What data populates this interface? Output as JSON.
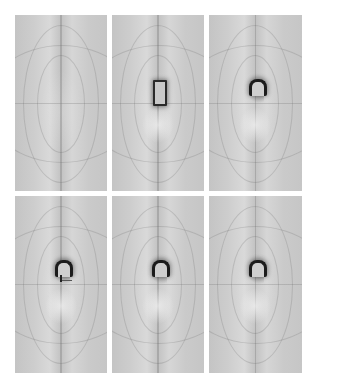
{
  "figure": {
    "layout": {
      "rows": 2,
      "columns": 3
    },
    "background_color": "#ffffff",
    "panel_tone": "grayscale",
    "panels": [
      {
        "row": 1,
        "col": 1,
        "object": "none"
      },
      {
        "row": 1,
        "col": 2,
        "object": "rectangular-outline"
      },
      {
        "row": 1,
        "col": 3,
        "object": "arched-cap"
      },
      {
        "row": 2,
        "col": 1,
        "object": "arched-cap-with-marker"
      },
      {
        "row": 2,
        "col": 2,
        "object": "arched-cap"
      },
      {
        "row": 2,
        "col": 3,
        "object": "arched-cap"
      }
    ]
  }
}
